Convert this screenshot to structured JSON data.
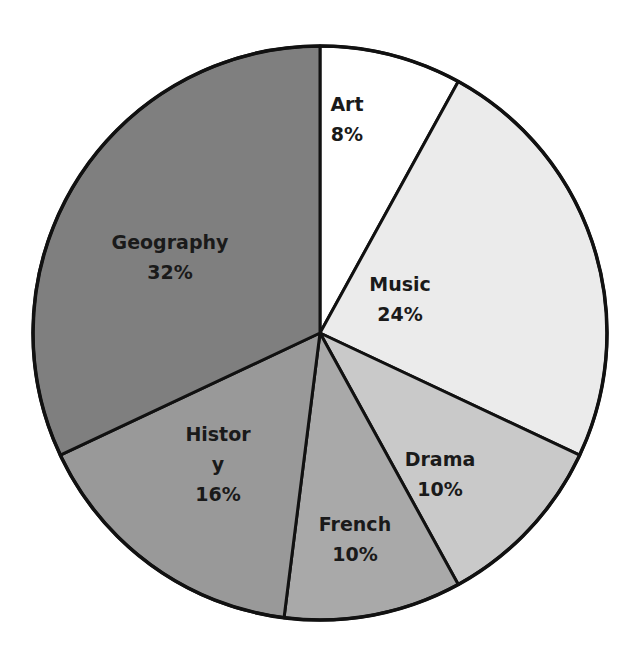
{
  "chart_data": {
    "type": "pie",
    "title": "",
    "start_angle_deg": 0,
    "direction": "clockwise",
    "slices": [
      {
        "label": "Art",
        "label_lines": [
          "Art"
        ],
        "value": 8,
        "value_text": "8%",
        "color": "#ffffff"
      },
      {
        "label": "Music",
        "label_lines": [
          "Music"
        ],
        "value": 24,
        "value_text": "24%",
        "color": "#ebebeb"
      },
      {
        "label": "Drama",
        "label_lines": [
          "Drama"
        ],
        "value": 10,
        "value_text": "10%",
        "color": "#c9c9c9"
      },
      {
        "label": "French",
        "label_lines": [
          "French"
        ],
        "value": 10,
        "value_text": "10%",
        "color": "#a9a9a9"
      },
      {
        "label": "History",
        "label_lines": [
          "Histor",
          "y"
        ],
        "value": 16,
        "value_text": "16%",
        "color": "#999999"
      },
      {
        "label": "Geography",
        "label_lines": [
          "Geography"
        ],
        "value": 32,
        "value_text": "32%",
        "color": "#7f7f7f"
      }
    ],
    "legend": "none",
    "labels_inside": true
  },
  "layout": {
    "cx": 320,
    "cy": 333,
    "r": 287,
    "stroke": "#111111",
    "stroke_width": 3
  },
  "label_positions": [
    {
      "x": 347,
      "y": 120
    },
    {
      "x": 400,
      "y": 300
    },
    {
      "x": 440,
      "y": 475
    },
    {
      "x": 355,
      "y": 540
    },
    {
      "x": 218,
      "y": 465
    },
    {
      "x": 170,
      "y": 258
    }
  ]
}
